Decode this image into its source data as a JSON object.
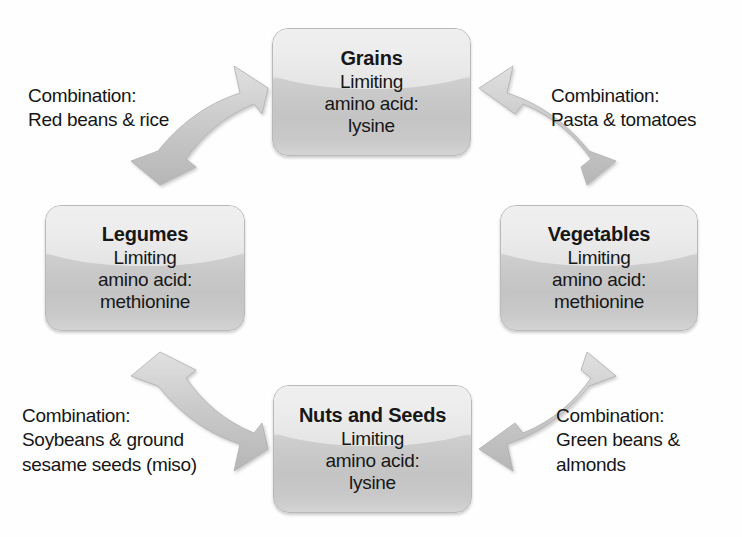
{
  "diagram": {
    "background_color": "#ffffff",
    "node_fill_light": "#f1f1f1",
    "node_fill_dark": "#c5c5c5",
    "arrow_color": "#c9c9c9",
    "text_color": "#161616"
  },
  "nodes": {
    "grains": {
      "title": "Grains",
      "line1": "Limiting",
      "line2": "amino acid:",
      "line3": "lysine"
    },
    "legumes": {
      "title": "Legumes",
      "line1": "Limiting",
      "line2": "amino acid:",
      "line3": "methionine"
    },
    "vegetables": {
      "title": "Vegetables",
      "line1": "Limiting",
      "line2": "amino acid:",
      "line3": "methionine"
    },
    "nuts_and_seeds": {
      "title": "Nuts and Seeds",
      "line1": "Limiting",
      "line2": "amino acid:",
      "line3": "lysine"
    }
  },
  "captions": {
    "top_left": {
      "line1": "Combination:",
      "line2": "Red beans & rice",
      "line3": ""
    },
    "top_right": {
      "line1": "Combination:",
      "line2": "Pasta & tomatoes",
      "line3": ""
    },
    "bottom_left": {
      "line1": "Combination:",
      "line2": "Soybeans & ground",
      "line3": "sesame seeds (miso)"
    },
    "bottom_right": {
      "line1": "Combination:",
      "line2": "Green beans &",
      "line3": "almonds"
    }
  },
  "arrows": {
    "legumes_grains": "double-headed-arrow",
    "grains_vegetables": "double-headed-arrow",
    "vegetables_nuts": "double-headed-arrow",
    "nuts_legumes": "double-headed-arrow"
  }
}
